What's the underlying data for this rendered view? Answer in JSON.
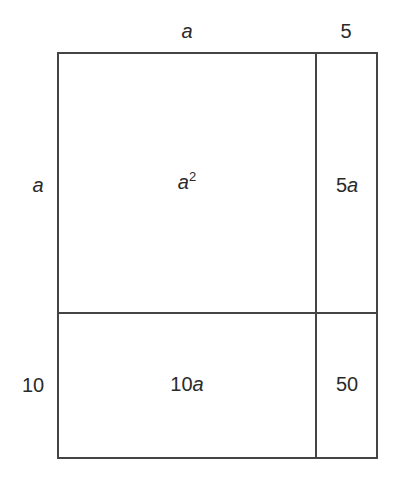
{
  "diagram": {
    "top_labels": {
      "left_width": "a",
      "right_width": "5"
    },
    "side_labels": {
      "top_height": "a",
      "bottom_height": "10"
    },
    "regions": {
      "top_left": {
        "coef": "",
        "var": "a",
        "exp": "2"
      },
      "top_right": {
        "coef": "5",
        "var": "a"
      },
      "bottom_left": {
        "coef": "10",
        "var": "a"
      },
      "bottom_right": {
        "value": "50"
      }
    },
    "colors": {
      "line": "#444444",
      "text": "#2a2a2a",
      "background": "#ffffff"
    }
  }
}
